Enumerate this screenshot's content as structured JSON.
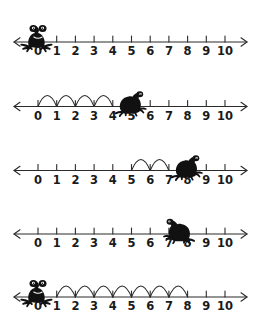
{
  "worksheet": {
    "title": "Frog number line jumps",
    "background_color": "#ffffff",
    "ink_color": "#2b2b2b",
    "frog_color": "#111111",
    "axis": {
      "min": 0,
      "max": 10,
      "tick_labels": [
        "0",
        "1",
        "2",
        "3",
        "4",
        "5",
        "6",
        "7",
        "8",
        "9",
        "10"
      ],
      "left_arrow": true,
      "right_arrow": true
    },
    "rows": [
      {
        "row_index": 1,
        "frog": {
          "position": 0,
          "facing": "front",
          "on_line": true
        },
        "jumps": {
          "count": 0,
          "from": null,
          "to": null
        },
        "arcs": []
      },
      {
        "row_index": 2,
        "frog": {
          "position": 5,
          "facing": "right",
          "on_line": true
        },
        "jumps": {
          "count": 4,
          "from": 0,
          "to": 4
        },
        "arcs": [
          {
            "from": 0,
            "to": 1
          },
          {
            "from": 1,
            "to": 2
          },
          {
            "from": 2,
            "to": 3
          },
          {
            "from": 3,
            "to": 4
          }
        ]
      },
      {
        "row_index": 3,
        "frog": {
          "position": 8,
          "facing": "right",
          "on_line": true
        },
        "jumps": {
          "count": 2,
          "from": 5,
          "to": 7
        },
        "arcs": [
          {
            "from": 5,
            "to": 6
          },
          {
            "from": 6,
            "to": 7
          }
        ]
      },
      {
        "row_index": 4,
        "frog": {
          "position": 7.5,
          "facing": "left",
          "on_line": true
        },
        "jumps": {
          "count": 0,
          "from": null,
          "to": null
        },
        "arcs": []
      },
      {
        "row_index": 5,
        "frog": {
          "position": 0,
          "facing": "front",
          "on_line": true
        },
        "jumps": {
          "count": 7,
          "from": 1,
          "to": 8
        },
        "arcs": [
          {
            "from": 1,
            "to": 2
          },
          {
            "from": 2,
            "to": 3
          },
          {
            "from": 3,
            "to": 4
          },
          {
            "from": 4,
            "to": 5
          },
          {
            "from": 5,
            "to": 6
          },
          {
            "from": 6,
            "to": 7
          },
          {
            "from": 7,
            "to": 8
          }
        ]
      }
    ]
  },
  "geometry": {
    "x_zero": 38,
    "x_step": 18.7,
    "baselines": [
      42,
      106.5,
      170.5,
      234,
      297
    ],
    "label_offset_y": 13,
    "tick_up": 6,
    "arc_height": 11,
    "axis_left_x": 14,
    "axis_right_x": 247
  }
}
